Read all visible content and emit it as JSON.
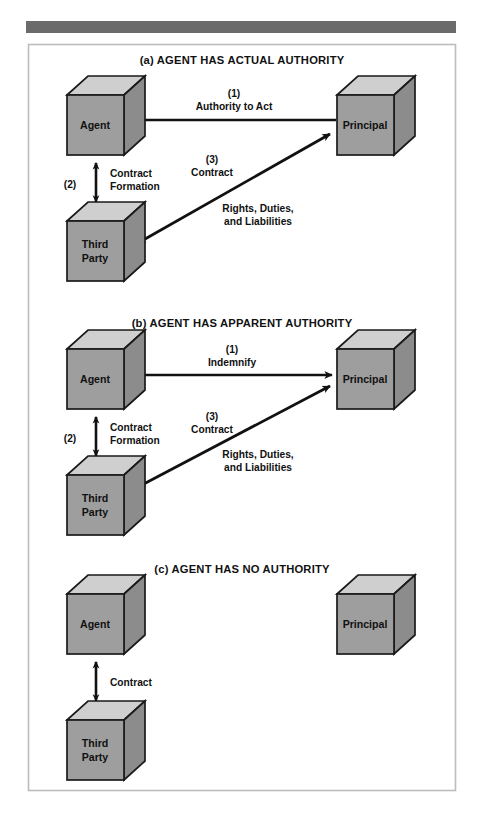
{
  "figure": {
    "top_rule": {
      "name": "header-rule",
      "color": "#6b6b6b"
    },
    "frame": {
      "name": "figure-frame",
      "border_color": "#b9b9b9"
    },
    "background": "#ffffff"
  },
  "palette": {
    "cube_front": "#9e9e9e",
    "cube_top": "#cfcfcf",
    "cube_side": "#8a8a8a",
    "cube_outline": "#1a1a1a",
    "arrow": "#111111",
    "text": "#111111"
  },
  "panels": [
    {
      "id": "a",
      "title": "(a)  AGENT HAS ACTUAL AUTHORITY",
      "nodes": [
        {
          "key": "agent",
          "label": "Agent"
        },
        {
          "key": "principal",
          "label": "Principal"
        },
        {
          "key": "third_party",
          "label_line1": "Third",
          "label_line2": "Party"
        }
      ],
      "flows": [
        {
          "key": "authority",
          "number": "(1)",
          "label": "Authority to Act",
          "from": "principal",
          "to": "agent",
          "direction": "single",
          "arrow_name": "arrow-principal-to-agent"
        },
        {
          "key": "contract_formation",
          "number": "(2)",
          "label_line1": "Contract",
          "label_line2": "Formation",
          "from": "agent",
          "to": "third_party",
          "direction": "double",
          "arrow_name": "arrow-agent-third-party"
        },
        {
          "key": "contract_rights",
          "number": "(3)",
          "label": "Contract",
          "sub_line1": "Rights, Duties,",
          "sub_line2": "and Liabilities",
          "from": "third_party",
          "to": "principal",
          "direction": "double",
          "arrow_name": "arrow-third-party-principal"
        }
      ]
    },
    {
      "id": "b",
      "title": "(b)  AGENT HAS  APPARENT AUTHORITY",
      "nodes": [
        {
          "key": "agent",
          "label": "Agent"
        },
        {
          "key": "principal",
          "label": "Principal"
        },
        {
          "key": "third_party",
          "label_line1": "Third",
          "label_line2": "Party"
        }
      ],
      "flows": [
        {
          "key": "indemnify",
          "number": "(1)",
          "label": "Indemnify",
          "from": "agent",
          "to": "principal",
          "direction": "double",
          "arrow_name": "arrow-agent-principal"
        },
        {
          "key": "contract_formation",
          "number": "(2)",
          "label_line1": "Contract",
          "label_line2": "Formation",
          "from": "agent",
          "to": "third_party",
          "direction": "double",
          "arrow_name": "arrow-agent-third-party"
        },
        {
          "key": "contract_rights",
          "number": "(3)",
          "label": "Contract",
          "sub_line1": "Rights, Duties,",
          "sub_line2": "and Liabilities",
          "from": "third_party",
          "to": "principal",
          "direction": "double",
          "arrow_name": "arrow-third-party-principal"
        }
      ]
    },
    {
      "id": "c",
      "title": "(c)  AGENT HAS NO AUTHORITY",
      "nodes": [
        {
          "key": "agent",
          "label": "Agent"
        },
        {
          "key": "principal",
          "label": "Principal"
        },
        {
          "key": "third_party",
          "label_line1": "Third",
          "label_line2": "Party"
        }
      ],
      "flows": [
        {
          "key": "contract",
          "number": "",
          "label": "Contract",
          "from": "agent",
          "to": "third_party",
          "direction": "double",
          "arrow_name": "arrow-agent-third-party"
        }
      ]
    }
  ]
}
